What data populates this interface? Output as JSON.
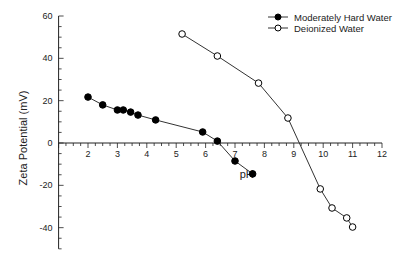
{
  "chart_data": {
    "type": "line",
    "title": "",
    "xlabel": "pH",
    "ylabel": "Zeta Potential (mV)",
    "xlim": [
      1,
      12
    ],
    "ylim": [
      -50,
      60
    ],
    "x_ticks": [
      2,
      3,
      4,
      5,
      6,
      7,
      8,
      9,
      10,
      11,
      12
    ],
    "y_ticks": [
      -40,
      -20,
      0,
      20,
      40,
      60
    ],
    "grid": false,
    "legend_position": "top-right",
    "series": [
      {
        "name": "Moderately Hard Water",
        "marker": "filled-circle",
        "x": [
          2.0,
          2.5,
          3.0,
          3.2,
          3.45,
          3.7,
          4.3,
          5.9,
          6.4,
          7.0,
          7.6
        ],
        "y": [
          21.7,
          18.0,
          15.6,
          15.6,
          14.6,
          13.2,
          10.9,
          5.2,
          0.9,
          -8.5,
          -14.6
        ]
      },
      {
        "name": "Deionized Water",
        "marker": "open-circle",
        "x": [
          5.2,
          6.4,
          7.8,
          8.8,
          9.9,
          10.3,
          10.8,
          11.0
        ],
        "y": [
          51.5,
          41.1,
          28.3,
          11.8,
          -21.7,
          -30.7,
          -35.4,
          -39.7
        ]
      }
    ]
  }
}
